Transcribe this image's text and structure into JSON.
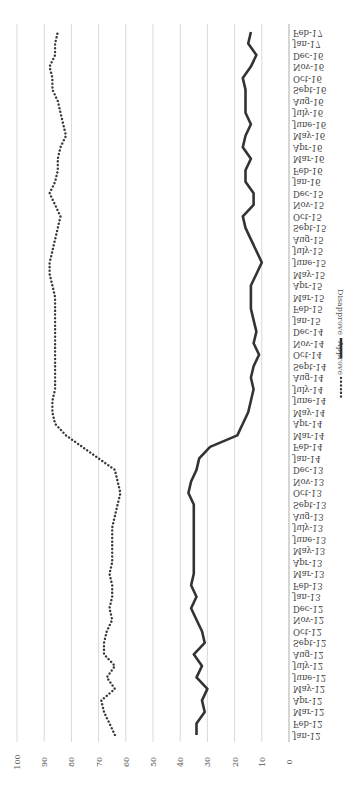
{
  "chart_data": {
    "type": "line",
    "title": "",
    "xlabel": "",
    "ylabel": "",
    "orientation": "rotated-90-clockwise",
    "ylim": [
      0,
      100
    ],
    "yticks": [
      0,
      10,
      20,
      30,
      40,
      50,
      60,
      70,
      80,
      90,
      100
    ],
    "grid": true,
    "legend_position": "bottom",
    "categories": [
      "Jan-12",
      "Feb-12",
      "Mar-12",
      "Apr-12",
      "May-12",
      "June-12",
      "July-12",
      "Aug-12",
      "Sept-12",
      "Oct-12",
      "Nov-12",
      "Dec-12",
      "Jan-13",
      "Feb-13",
      "Mar-13",
      "Apr-13",
      "May-13",
      "June-13",
      "July-13",
      "Aug-13",
      "Sept-13",
      "Oct-13",
      "Nov-13",
      "Dec-13",
      "Jan-14",
      "Feb-14",
      "Mar-14",
      "Apr-14",
      "May-14",
      "June-14",
      "July-14",
      "Aug-14",
      "Sept-14",
      "Oct-14",
      "Nov-14",
      "Dec-14",
      "Jan-15",
      "Feb-15",
      "Mar-15",
      "Apr-15",
      "May-15",
      "June-15",
      "July-15",
      "Aug-15",
      "Sept-15",
      "Oct-15",
      "Nov-15",
      "Dec-15",
      "Jan-16",
      "Feb-16",
      "Mar-16",
      "Apr-16",
      "May-16",
      "June-16",
      "July-16",
      "Aug-16",
      "Sept-16",
      "Oct-16",
      "Nov-16",
      "Dec-16",
      "Jan-17",
      "Feb-17"
    ],
    "series": [
      {
        "name": "Approve",
        "style": "dotted",
        "values": [
          64,
          66,
          68,
          69,
          64,
          67,
          64,
          68,
          68,
          67,
          65,
          66,
          65,
          65,
          66,
          65,
          65,
          65,
          65,
          64,
          63,
          62,
          63,
          64,
          70,
          76,
          82,
          86,
          87,
          87,
          86,
          86,
          86,
          86,
          86,
          86,
          86,
          86,
          86,
          87,
          88,
          88,
          87,
          86,
          85,
          84,
          86,
          88,
          86,
          85,
          85,
          84,
          82,
          83,
          84,
          85,
          87,
          87,
          88,
          86,
          86,
          85
        ]
      },
      {
        "name": "Disapprove",
        "style": "solid",
        "values": [
          34,
          34,
          31,
          32,
          30,
          34,
          32,
          35,
          31,
          32,
          34,
          36,
          34,
          36,
          35,
          35,
          35,
          35,
          35,
          35,
          35,
          37,
          36,
          34,
          33,
          29,
          19,
          17,
          15,
          14,
          13,
          14,
          13,
          11,
          13,
          12,
          13,
          14,
          14,
          14,
          12,
          10,
          12,
          14,
          16,
          17,
          13,
          13,
          16,
          16,
          14,
          17,
          16,
          14,
          16,
          16,
          16,
          17,
          14,
          12,
          15,
          14
        ]
      }
    ]
  },
  "legend": {
    "items": [
      {
        "label": "Approve",
        "style": "dotted"
      },
      {
        "label": "Disapprove",
        "style": "solid"
      }
    ]
  },
  "colors": {
    "line": "#333333",
    "grid": "#d9d9d9",
    "text": "#555555",
    "background": "#ffffff"
  }
}
